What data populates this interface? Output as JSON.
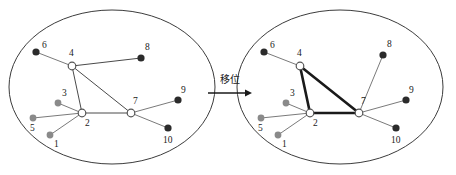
{
  "figure": {
    "transition": {
      "label": "移位",
      "arrow_icon": "right-arrow-icon"
    }
  },
  "chart_data": {
    "type": "diagram",
    "title": "",
    "node_styles": {
      "hub": "#ffffff",
      "dark": "#2b2b2b",
      "gray": "#8a8a8a"
    },
    "panels": [
      {
        "name": "before",
        "ellipse": {
          "cx": 112,
          "cy": 87,
          "rx": 103,
          "ry": 77
        },
        "nodes": [
          {
            "id": "1",
            "label": "1",
            "x": 50,
            "y": 135,
            "style": "gray",
            "r": 3.4,
            "lx": 54,
            "ly": 147
          },
          {
            "id": "2",
            "label": "2",
            "x": 82,
            "y": 113,
            "style": "hub",
            "r": 3.8,
            "lx": 85,
            "ly": 126
          },
          {
            "id": "3",
            "label": "3",
            "x": 58,
            "y": 103,
            "style": "gray",
            "r": 3.4,
            "lx": 62,
            "ly": 96
          },
          {
            "id": "4",
            "label": "4",
            "x": 72,
            "y": 66,
            "style": "hub",
            "r": 3.8,
            "lx": 69,
            "ly": 56
          },
          {
            "id": "5",
            "label": "5",
            "x": 33,
            "y": 118,
            "style": "gray",
            "r": 3.4,
            "lx": 30,
            "ly": 131
          },
          {
            "id": "6",
            "label": "6",
            "x": 36,
            "y": 52,
            "style": "dark",
            "r": 3.6,
            "lx": 42,
            "ly": 48
          },
          {
            "id": "7",
            "label": "7",
            "x": 131,
            "y": 113,
            "style": "hub",
            "r": 3.8,
            "lx": 133,
            "ly": 104
          },
          {
            "id": "8",
            "label": "8",
            "x": 141,
            "y": 58,
            "style": "dark",
            "r": 3.6,
            "lx": 145,
            "ly": 50
          },
          {
            "id": "9",
            "label": "9",
            "x": 178,
            "y": 100,
            "style": "dark",
            "r": 3.6,
            "lx": 181,
            "ly": 93
          },
          {
            "id": "10",
            "label": "10",
            "x": 168,
            "y": 128,
            "style": "dark",
            "r": 3.6,
            "lx": 163,
            "ly": 143
          }
        ],
        "edges": [
          {
            "from": "6",
            "to": "4",
            "style": "thin"
          },
          {
            "from": "4",
            "to": "8",
            "style": "dark"
          },
          {
            "from": "4",
            "to": "2",
            "style": "dark"
          },
          {
            "from": "4",
            "to": "7",
            "style": "dark"
          },
          {
            "from": "2",
            "to": "7",
            "style": "dark"
          },
          {
            "from": "3",
            "to": "2",
            "style": "thin"
          },
          {
            "from": "5",
            "to": "2",
            "style": "thin"
          },
          {
            "from": "1",
            "to": "2",
            "style": "thin"
          },
          {
            "from": "7",
            "to": "9",
            "style": "thin"
          },
          {
            "from": "7",
            "to": "10",
            "style": "thin"
          }
        ]
      },
      {
        "name": "after",
        "ellipse": {
          "cx": 340,
          "cy": 87,
          "rx": 103,
          "ry": 77
        },
        "nodes": [
          {
            "id": "1",
            "label": "1",
            "x": 278,
            "y": 135,
            "style": "gray",
            "r": 3.4,
            "lx": 282,
            "ly": 147
          },
          {
            "id": "2",
            "label": "2",
            "x": 310,
            "y": 113,
            "style": "hub",
            "r": 3.8,
            "lx": 313,
            "ly": 126
          },
          {
            "id": "3",
            "label": "3",
            "x": 286,
            "y": 103,
            "style": "gray",
            "r": 3.4,
            "lx": 290,
            "ly": 96
          },
          {
            "id": "4",
            "label": "4",
            "x": 300,
            "y": 66,
            "style": "hub",
            "r": 3.8,
            "lx": 297,
            "ly": 56
          },
          {
            "id": "5",
            "label": "5",
            "x": 261,
            "y": 118,
            "style": "gray",
            "r": 3.4,
            "lx": 258,
            "ly": 131
          },
          {
            "id": "6",
            "label": "6",
            "x": 264,
            "y": 52,
            "style": "dark",
            "r": 3.6,
            "lx": 270,
            "ly": 48
          },
          {
            "id": "7",
            "label": "7",
            "x": 359,
            "y": 113,
            "style": "hub",
            "r": 3.8,
            "lx": 361,
            "ly": 104
          },
          {
            "id": "8",
            "label": "8",
            "x": 383,
            "y": 55,
            "style": "dark",
            "r": 3.6,
            "lx": 387,
            "ly": 47
          },
          {
            "id": "9",
            "label": "9",
            "x": 406,
            "y": 100,
            "style": "dark",
            "r": 3.6,
            "lx": 409,
            "ly": 93
          },
          {
            "id": "10",
            "label": "10",
            "x": 396,
            "y": 128,
            "style": "dark",
            "r": 3.6,
            "lx": 391,
            "ly": 143
          }
        ],
        "edges": [
          {
            "from": "6",
            "to": "4",
            "style": "thin"
          },
          {
            "from": "4",
            "to": "2",
            "style": "bold"
          },
          {
            "from": "4",
            "to": "7",
            "style": "bold"
          },
          {
            "from": "2",
            "to": "7",
            "style": "bold"
          },
          {
            "from": "3",
            "to": "2",
            "style": "thin"
          },
          {
            "from": "5",
            "to": "2",
            "style": "thin"
          },
          {
            "from": "1",
            "to": "2",
            "style": "thin"
          },
          {
            "from": "8",
            "to": "7",
            "style": "thin"
          },
          {
            "from": "7",
            "to": "9",
            "style": "thin"
          },
          {
            "from": "7",
            "to": "10",
            "style": "thin"
          }
        ]
      }
    ],
    "transition": {
      "label": "移位",
      "from_panel": "before",
      "to_panel": "after",
      "arrow": {
        "x1": 208,
        "y1": 93,
        "x2": 252,
        "y2": 93
      },
      "label_pos": {
        "x": 230,
        "y": 83
      }
    }
  }
}
